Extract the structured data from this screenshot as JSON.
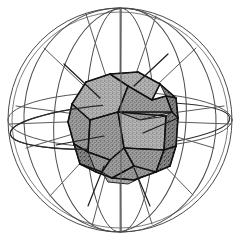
{
  "figure": {
    "alt_text": "Line drawing of a wireframe sphere with great-circle meridians and an equator, containing a gray stippled truncated-octahedron-like polyhedron at its center, with radial spokes from the polyhedron face centers to the sphere surface.",
    "background_color": "#ffffff",
    "canvas": {
      "width": 241,
      "height": 244
    }
  },
  "style": {
    "sphere_line_color": "#4a4a4a",
    "sphere_line_color_light": "#7d7d7d",
    "spoke_color": "#5a5a5a",
    "spoke_color_dark": "#1c1c1c",
    "polyhedron_edge_color": "#111111",
    "polyhedron_fill_color": "#9c9c9c",
    "polyhedron_fill_light": "#b0b0b0",
    "polyhedron_fill_dark": "#888888",
    "stipple_dot_color": "#3a3a3a",
    "sphere_stroke_width": 1.0,
    "spoke_stroke_width": 1.0,
    "polyhedron_stroke_width": 1.6
  },
  "geometry": {
    "sphere": {
      "label": "circumscribed-sphere",
      "center_x": 120,
      "center_y": 120,
      "radius_outer": 112,
      "radius_inner": 108
    },
    "equator": {
      "label": "equator-ellipse",
      "center_x": 120,
      "center_y": 120,
      "rx": 112,
      "ry": 28
    },
    "equator_tilted": {
      "label": "equator-tilted-ellipse",
      "center_x": 120,
      "center_y": 126,
      "rx": 110,
      "ry": 22,
      "rotation": -4
    },
    "meridians": [
      {
        "label": "meridian-vertical-line",
        "rx": 1,
        "ry": 112,
        "rotation": 0
      },
      {
        "label": "meridian-narrow",
        "rx": 34,
        "ry": 112,
        "rotation": 0
      },
      {
        "label": "meridian-medium",
        "rx": 66,
        "ry": 112,
        "rotation": 4
      },
      {
        "label": "meridian-wide",
        "rx": 96,
        "ry": 112,
        "rotation": -3
      }
    ],
    "spokes": [
      {
        "label": "spoke-upper-left",
        "x1": 120,
        "y1": 120,
        "x2": 44,
        "y2": 48
      },
      {
        "label": "spoke-upper-right",
        "x1": 120,
        "y1": 120,
        "x2": 196,
        "y2": 48
      },
      {
        "label": "spoke-lower-left",
        "x1": 120,
        "y1": 120,
        "x2": 50,
        "y2": 196
      },
      {
        "label": "spoke-lower-right",
        "x1": 120,
        "y1": 120,
        "x2": 193,
        "y2": 195
      },
      {
        "label": "spoke-left",
        "x1": 120,
        "y1": 120,
        "x2": 10,
        "y2": 124
      },
      {
        "label": "spoke-right",
        "x1": 120,
        "y1": 120,
        "x2": 230,
        "y2": 124
      },
      {
        "label": "spoke-top",
        "x1": 120,
        "y1": 120,
        "x2": 121,
        "y2": 8
      },
      {
        "label": "spoke-bottom",
        "x1": 120,
        "y1": 120,
        "x2": 121,
        "y2": 232
      },
      {
        "label": "spoke-left-upper-shallow",
        "x1": 120,
        "y1": 120,
        "x2": 16,
        "y2": 106
      },
      {
        "label": "spoke-left-lower-shallow",
        "x1": 120,
        "y1": 120,
        "x2": 26,
        "y2": 148
      },
      {
        "label": "spoke-right-upper-shallow",
        "x1": 120,
        "y1": 120,
        "x2": 224,
        "y2": 106
      },
      {
        "label": "spoke-right-lower-shallow",
        "x1": 120,
        "y1": 120,
        "x2": 214,
        "y2": 148
      },
      {
        "label": "spoke-top-left-steep",
        "x1": 120,
        "y1": 120,
        "x2": 86,
        "y2": 14
      },
      {
        "label": "spoke-top-right-steep",
        "x1": 120,
        "y1": 120,
        "x2": 156,
        "y2": 16
      },
      {
        "label": "spoke-bottom-left-steep",
        "x1": 120,
        "y1": 120,
        "x2": 92,
        "y2": 226
      },
      {
        "label": "spoke-bottom-right-steep",
        "x1": 120,
        "y1": 120,
        "x2": 152,
        "y2": 224
      }
    ],
    "polyhedron": {
      "label": "inscribed-truncated-polyhedron",
      "face_count": 13,
      "bounds": {
        "x": 70,
        "y": 71,
        "width": 108,
        "height": 108
      },
      "faces": [
        {
          "name": "face-top-left-hex",
          "tone": "light",
          "points": "72,104 86,82 110,74 128,86 118,112 90,120"
        },
        {
          "name": "face-top-cap",
          "tone": "light",
          "points": "110,74 138,72 160,84 152,100 128,86"
        },
        {
          "name": "face-top-right-pent",
          "tone": "mid",
          "points": "128,86 152,100 166,96 172,112 140,120 118,112"
        },
        {
          "name": "face-upper-right-edge",
          "tone": "dark",
          "points": "160,84 176,98 178,118 172,112 166,96"
        },
        {
          "name": "face-left-hex",
          "tone": "mid",
          "points": "72,104 90,120 88,152 74,144 68,122"
        },
        {
          "name": "face-center-left-pent",
          "tone": "mid",
          "points": "90,120 118,112 124,148 110,160 88,152"
        },
        {
          "name": "face-center-square",
          "tone": "light",
          "points": "124,148 118,112 140,120 166,116 164,150"
        },
        {
          "name": "face-right-pent",
          "tone": "dark",
          "points": "166,116 172,112 178,118 176,146 164,150"
        },
        {
          "name": "face-lower-left",
          "tone": "dark",
          "points": "74,144 88,152 110,160 102,172 80,164"
        },
        {
          "name": "face-bottom-left-pent",
          "tone": "mid",
          "points": "88,152 110,160 124,148 134,166 112,178 96,172"
        },
        {
          "name": "face-bottom-hex",
          "tone": "mid",
          "points": "124,148 164,150 156,172 134,180 112,178 134,166"
        },
        {
          "name": "face-bottom-right",
          "tone": "dark",
          "points": "164,150 176,146 170,166 156,172"
        },
        {
          "name": "face-bottom-cap",
          "tone": "light",
          "points": "102,172 112,178 134,180 144,176 128,184 108,182"
        }
      ],
      "edges": [
        "72,104 86,82",
        "86,82 110,74",
        "110,74 138,72",
        "138,72 160,84",
        "160,84 176,98",
        "176,98 178,118",
        "178,118 176,146",
        "176,146 170,166",
        "170,166 156,172",
        "156,172 134,180",
        "134,180 112,178",
        "112,178 96,172",
        "96,172 80,164",
        "80,164 74,144",
        "74,144 68,122",
        "68,122 72,104",
        "110,74 128,86",
        "128,86 118,112",
        "118,112 90,120",
        "90,120 72,104",
        "128,86 152,100",
        "152,100 166,96",
        "166,96 172,112",
        "172,112 118,112",
        "152,100 160,84",
        "166,96 176,98",
        "172,112 178,118",
        "90,120 88,152",
        "88,152 74,144",
        "118,112 124,148",
        "124,148 110,160",
        "110,160 88,152",
        "124,148 164,150",
        "164,150 166,116",
        "166,116 118,112",
        "164,150 176,146",
        "110,160 102,172",
        "102,172 80,164",
        "124,148 134,166",
        "134,166 112,178",
        "134,166 156,172",
        "164,150 156,172"
      ],
      "inner_spokes": [
        {
          "label": "inner-spoke-top-left-face",
          "x1": 100,
          "y1": 98,
          "x2": 64,
          "y2": 64
        },
        {
          "label": "inner-spoke-top-face",
          "x1": 134,
          "y1": 86,
          "x2": 168,
          "y2": 54
        },
        {
          "label": "inner-spoke-center-face",
          "x1": 143,
          "y1": 133,
          "x2": 178,
          "y2": 118
        },
        {
          "label": "inner-spoke-left-face",
          "x1": 104,
          "y1": 136,
          "x2": 56,
          "y2": 145
        },
        {
          "label": "inner-spoke-bottom-face",
          "x1": 134,
          "y1": 168,
          "x2": 150,
          "y2": 206
        },
        {
          "label": "inner-spoke-bottom-left-face",
          "x1": 104,
          "y1": 166,
          "x2": 88,
          "y2": 206
        }
      ]
    }
  }
}
